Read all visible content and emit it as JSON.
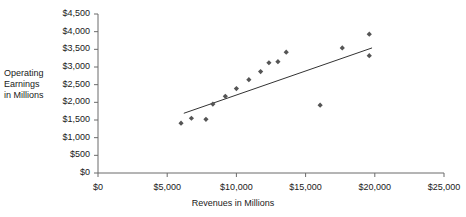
{
  "chart_data": {
    "type": "scatter",
    "title": "",
    "xlabel": "Revenues in Millions",
    "ylabel": "Operating\nEarnings\nin Millions",
    "xlim": [
      0,
      25000
    ],
    "ylim": [
      0,
      4500
    ],
    "xticks": [
      0,
      5000,
      10000,
      15000,
      20000,
      25000
    ],
    "yticks": [
      0,
      500,
      1000,
      1500,
      2000,
      2500,
      3000,
      3500,
      4000,
      4500
    ],
    "xtick_labels": [
      "$0",
      "$5,000",
      "$10,000",
      "$15,000",
      "$20,000",
      "$25,000"
    ],
    "ytick_labels": [
      "$0",
      "$500",
      "$1,000",
      "$1,500",
      "$2,000",
      "$2,500",
      "$3,000",
      "$3,500",
      "$4,000",
      "$4,500"
    ],
    "grid": false,
    "legend": false,
    "marker_shape": "diamond",
    "marker_color": "#555555",
    "series": [
      {
        "name": "Operating Earnings vs Revenues",
        "points": [
          {
            "x": 6000,
            "y": 1410
          },
          {
            "x": 6750,
            "y": 1550
          },
          {
            "x": 7800,
            "y": 1520
          },
          {
            "x": 8300,
            "y": 1950
          },
          {
            "x": 9200,
            "y": 2170
          },
          {
            "x": 10000,
            "y": 2390
          },
          {
            "x": 10900,
            "y": 2640
          },
          {
            "x": 11750,
            "y": 2870
          },
          {
            "x": 12350,
            "y": 3120
          },
          {
            "x": 13000,
            "y": 3150
          },
          {
            "x": 13600,
            "y": 3420
          },
          {
            "x": 16050,
            "y": 1920
          },
          {
            "x": 17650,
            "y": 3540
          },
          {
            "x": 19600,
            "y": 3930
          },
          {
            "x": 19600,
            "y": 3320
          }
        ]
      }
    ],
    "trendline": {
      "name": "linear-fit",
      "color": "#333333",
      "x_start": 6200,
      "y_start": 1690,
      "x_end": 19800,
      "y_end": 3540
    }
  },
  "axis_titles": {
    "y": "Operating\nEarnings\nin Millions",
    "x": "Revenues in Millions"
  }
}
